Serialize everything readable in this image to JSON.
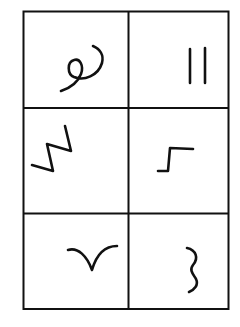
{
  "figure": {
    "title": "Symbol grid",
    "rows": 3,
    "columns": 2,
    "colors": {
      "ink": "#111111",
      "background": "#ffffff"
    },
    "cells": [
      {
        "row": 1,
        "col": 1,
        "symbol": "loop-curl-icon",
        "description": "curl with a small loop"
      },
      {
        "row": 1,
        "col": 2,
        "symbol": "double-bar-icon",
        "description": "two vertical parallel lines"
      },
      {
        "row": 2,
        "col": 1,
        "symbol": "zigzag-icon",
        "description": "lightning-like zigzag"
      },
      {
        "row": 2,
        "col": 2,
        "symbol": "step-icon",
        "description": "step / raised corner line"
      },
      {
        "row": 3,
        "col": 1,
        "symbol": "bird-v-icon",
        "description": "curved V like a bird in flight"
      },
      {
        "row": 3,
        "col": 2,
        "symbol": "wavy-three-icon",
        "description": "wavy shape resembling the digit 3"
      }
    ]
  }
}
